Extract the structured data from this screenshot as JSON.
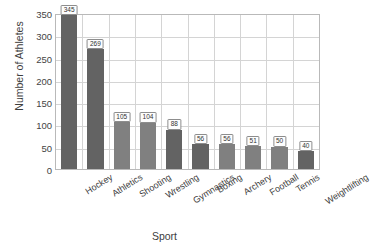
{
  "chart_data": {
    "type": "bar",
    "title": "",
    "xlabel": "Sport",
    "ylabel": "Number of Athletes",
    "categories": [
      "Hockey",
      "Athletics",
      "Shooting",
      "Wrestling",
      "Gymnastics",
      "Boxing",
      "Archery",
      "Football",
      "Tennis",
      "Weightlifting"
    ],
    "values": [
      345,
      269,
      105,
      104,
      88,
      56,
      56,
      51,
      50,
      40
    ],
    "data_labels": [
      "345",
      "269",
      "105",
      "104",
      "88",
      "56",
      "56",
      "51",
      "50",
      "40"
    ],
    "ylim": [
      0,
      350
    ],
    "yticks": [
      0,
      50,
      100,
      150,
      200,
      250,
      300,
      350
    ],
    "ytick_labels": [
      "0",
      "50",
      "100",
      "150",
      "200",
      "250",
      "300",
      "350"
    ],
    "grid": "both",
    "legend": "none",
    "bar_colors": [
      "#636363",
      "#636363",
      "#808080",
      "#808080",
      "#636363",
      "#636363",
      "#808080",
      "#808080",
      "#808080",
      "#636363"
    ],
    "colors": {
      "bar_light": "#808080",
      "bar_dark": "#636363",
      "grid": "#d4d4d4",
      "frame": "#b9b9b9",
      "text": "#3d3d3d",
      "label_box_bg": "#fdfdfd",
      "label_box_border": "#8d8d8d"
    }
  }
}
